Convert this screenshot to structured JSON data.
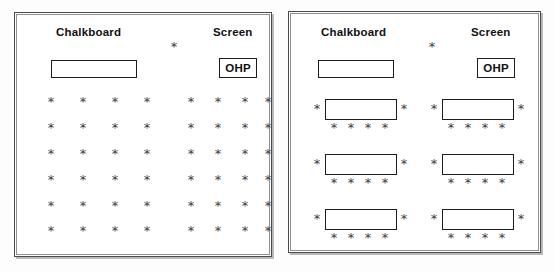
{
  "figure": {
    "type": "classroom-seating-diagram",
    "panels": [
      {
        "id": "traditional-rows",
        "labels": {
          "chalkboard": "Chalkboard",
          "screen": "Screen",
          "ohp": "OHP"
        },
        "teacher_mark": "*",
        "seat_mark": "*",
        "seat_rows": 6,
        "seats_per_block": 4,
        "blocks_per_row": 2,
        "total_seats": 48,
        "seat_columns_x": [
          50,
          82,
          114,
          146,
          189,
          216,
          243,
          266
        ],
        "seat_rows_y": [
          101,
          127,
          153,
          179,
          205,
          230
        ],
        "teacher_pos": {
          "x": 173,
          "y": 46
        },
        "chalkboard_box": {
          "x": 50,
          "y": 60,
          "w": 86,
          "h": 18
        },
        "ohp_box": {
          "x": 218,
          "y": 58,
          "w": 38,
          "h": 20
        },
        "chalkboard_label_pos": {
          "x": 55,
          "y": 26
        },
        "screen_label_pos": {
          "x": 212,
          "y": 26
        }
      },
      {
        "id": "table-groups",
        "labels": {
          "chalkboard": "Chalkboard",
          "screen": "Screen",
          "ohp": "OHP"
        },
        "teacher_mark": "*",
        "seat_mark": "*",
        "table_rows": 3,
        "tables_per_row": 2,
        "total_tables": 6,
        "seats_per_table": 6,
        "total_seats": 36,
        "teacher_pos": {
          "x": 430,
          "y": 46
        },
        "chalkboard_box": {
          "x": 318,
          "y": 60,
          "w": 76,
          "h": 18
        },
        "ohp_box": {
          "x": 477,
          "y": 58,
          "w": 38,
          "h": 20
        },
        "chalkboard_label_pos": {
          "x": 322,
          "y": 26
        },
        "screen_label_pos": {
          "x": 472,
          "y": 26
        },
        "table_cols_x": [
          324,
          441
        ],
        "table_rows_y": [
          98,
          153,
          208
        ],
        "table_size": {
          "w": 72,
          "h": 21
        }
      }
    ]
  }
}
